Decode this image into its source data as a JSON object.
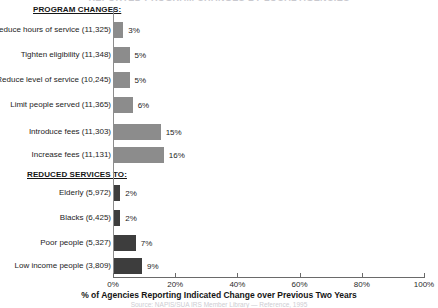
{
  "title": "REPORTED PROGRAM CHANGES BY LOCAL AGENCIES",
  "source_note": "Source: NAPIS/SUA IRS Member Library — Reference, 1995",
  "colors": {
    "bar_program": "#8c8c8c",
    "bar_reduced": "#3d3d3d",
    "axis": "#6a6a6a",
    "text": "#1d1d1d",
    "background": "#ffffff"
  },
  "sections": [
    {
      "key": "program",
      "header": "PROGRAM CHANGES:"
    },
    {
      "key": "reduced",
      "header": "REDUCED SERVICES TO:"
    }
  ],
  "axis": {
    "title": "% of Agencies Reporting Indicated Change over Previous Two Years",
    "ticks": [
      "0%",
      "20%",
      "40%",
      "60%",
      "80%",
      "100%"
    ],
    "min": 0,
    "max": 100
  },
  "chart_data": {
    "type": "bar",
    "orientation": "horizontal",
    "title": "REPORTED PROGRAM CHANGES BY LOCAL AGENCIES",
    "xlabel": "% of Agencies Reporting Indicated Change over Previous Two Years",
    "ylabel": "",
    "xlim": [
      0,
      100
    ],
    "xticks": [
      0,
      20,
      40,
      60,
      80,
      100
    ],
    "xticklabels": [
      "0%",
      "20%",
      "40%",
      "60%",
      "80%",
      "100%"
    ],
    "grid": false,
    "legend": null,
    "groups": [
      {
        "name": "PROGRAM CHANGES:",
        "categories": [
          "Reduce hours of service (11,325)",
          "Tighten eligibility (11,348)",
          "Reduce level of service (10,245)",
          "Limit people served (11,365)",
          "Introduce fees (11,303)",
          "Increase fees (11,131)"
        ],
        "values": [
          3,
          5,
          5,
          6,
          15,
          16
        ],
        "value_labels": [
          "3%",
          "5%",
          "5%",
          "6%",
          "15%",
          "16%"
        ],
        "color": "#8c8c8c"
      },
      {
        "name": "REDUCED SERVICES TO:",
        "categories": [
          "Elderly (5,972)",
          "Blacks (6,425)",
          "Poor people (5,327)",
          "Low income people (3,809)"
        ],
        "values": [
          2,
          2,
          7,
          9
        ],
        "value_labels": [
          "2%",
          "2%",
          "7%",
          "9%"
        ],
        "color": "#3d3d3d"
      }
    ]
  },
  "bars": [
    {
      "label": "Reduce hours of service (11,325)",
      "value": 3,
      "value_label": "3%",
      "group": "program",
      "top": 22
    },
    {
      "label": "Tighten eligibility (11,348)",
      "value": 5,
      "value_label": "5%",
      "group": "program",
      "top": 47
    },
    {
      "label": "Reduce level of service (10,245)",
      "value": 5,
      "value_label": "5%",
      "group": "program",
      "top": 72
    },
    {
      "label": "Limit people served (11,365)",
      "value": 6,
      "value_label": "6%",
      "group": "program",
      "top": 97
    },
    {
      "label": "Introduce fees (11,303)",
      "value": 15,
      "value_label": "15%",
      "group": "program",
      "top": 124
    },
    {
      "label": "Increase fees (11,131)",
      "value": 16,
      "value_label": "16%",
      "group": "program",
      "top": 147
    },
    {
      "label": "Elderly (5,972)",
      "value": 2,
      "value_label": "2%",
      "group": "reduced",
      "top": 185
    },
    {
      "label": "Blacks (6,425)",
      "value": 2,
      "value_label": "2%",
      "group": "reduced",
      "top": 210
    },
    {
      "label": "Poor people (5,327)",
      "value": 7,
      "value_label": "7%",
      "group": "reduced",
      "top": 235
    },
    {
      "label": "Low income people (3,809)",
      "value": 9,
      "value_label": "9%",
      "group": "reduced",
      "top": 258
    }
  ]
}
